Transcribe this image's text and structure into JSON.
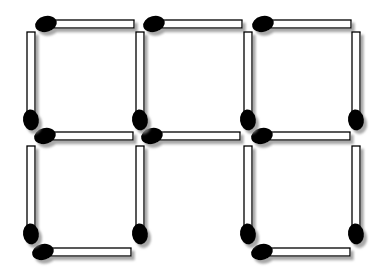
{
  "figure": {
    "type": "matchstick-puzzle",
    "canvas": {
      "width": 381,
      "height": 277,
      "background": "#ffffff"
    },
    "style": {
      "stick_fill": "#ffffff",
      "stick_stroke": "#000000",
      "stick_stroke_width": 1.3,
      "stick_thickness": 8,
      "stick_length": 82,
      "head_offset": 6,
      "head_color": "#000000",
      "head_rx_horizontal": 11,
      "head_ry_horizontal": 8,
      "head_tilt_horizontal": -14,
      "head_rx_vertical": 8,
      "head_ry_vertical": 10.5,
      "head_tilt_vertical": -8,
      "shadow": {
        "dx": 3,
        "dy": 3.5,
        "blur": 1.3,
        "color": "#8a8a8a",
        "opacity": 0.75
      }
    },
    "layout": {
      "grid_rows": 2,
      "grid_cols": 3,
      "horizontal_head_side": "left",
      "vertical_head_side": "bottom",
      "match_count": 16,
      "missing_edge": "bottom-edge-col2"
    },
    "matches": [
      {
        "name": "match-top-edge-col1",
        "o": "h",
        "x": 46,
        "y": 24
      },
      {
        "name": "match-top-edge-col2",
        "o": "h",
        "x": 154,
        "y": 24
      },
      {
        "name": "match-top-edge-col3",
        "o": "h",
        "x": 263,
        "y": 24
      },
      {
        "name": "match-mid-edge-col1",
        "o": "h",
        "x": 45,
        "y": 136
      },
      {
        "name": "match-mid-edge-col2",
        "o": "h",
        "x": 152,
        "y": 136
      },
      {
        "name": "match-mid-edge-col3",
        "o": "h",
        "x": 262,
        "y": 136
      },
      {
        "name": "match-bottom-edge-col1",
        "o": "h",
        "x": 43,
        "y": 252
      },
      {
        "name": "match-bottom-edge-col3",
        "o": "h",
        "x": 262,
        "y": 252
      },
      {
        "name": "match-vertical-x1-row1",
        "o": "v",
        "x": 31,
        "y": 120
      },
      {
        "name": "match-vertical-x2-row1",
        "o": "v",
        "x": 140,
        "y": 120
      },
      {
        "name": "match-vertical-x3-row1",
        "o": "v",
        "x": 248,
        "y": 120
      },
      {
        "name": "match-vertical-x4-row1",
        "o": "v",
        "x": 356,
        "y": 120
      },
      {
        "name": "match-vertical-x1-row2",
        "o": "v",
        "x": 31,
        "y": 234
      },
      {
        "name": "match-vertical-x2-row2",
        "o": "v",
        "x": 140,
        "y": 234
      },
      {
        "name": "match-vertical-x3-row2",
        "o": "v",
        "x": 248,
        "y": 234
      },
      {
        "name": "match-vertical-x4-row2",
        "o": "v",
        "x": 356,
        "y": 234
      }
    ]
  }
}
